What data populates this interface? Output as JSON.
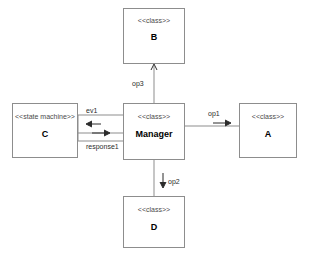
{
  "diagram": {
    "kind": "uml-structure-diagram",
    "background_color": "#ffffff",
    "line_color": "#8d8d8d",
    "text_color": "#000000",
    "nodes": [
      {
        "id": "b",
        "stereotype": "<<class>>",
        "name": "B"
      },
      {
        "id": "manager",
        "stereotype": "<<class>>",
        "name": "Manager"
      },
      {
        "id": "c",
        "stereotype": "<<state machine>>",
        "name": "C"
      },
      {
        "id": "a",
        "stereotype": "<<class>>",
        "name": "A"
      },
      {
        "id": "d",
        "stereotype": "<<class>>",
        "name": "D"
      }
    ],
    "edges": [
      {
        "id": "op3",
        "label": "op3",
        "from": "manager",
        "to": "b",
        "direction": "up",
        "arrow": "open-arrow"
      },
      {
        "id": "op1",
        "label": "op1",
        "from": "manager",
        "to": "a",
        "direction": "right",
        "arrow": "open-arrow"
      },
      {
        "id": "op2",
        "label": "op2",
        "from": "manager",
        "to": "d",
        "direction": "down",
        "arrow": "open-arrow"
      },
      {
        "id": "ev1",
        "label": "ev1",
        "from": "c",
        "to": "manager",
        "direction": "left",
        "arrow": "open-arrow"
      },
      {
        "id": "response1",
        "label": "response1",
        "from": "manager",
        "to": "c",
        "direction": "right",
        "arrow": "open-arrow"
      }
    ]
  }
}
